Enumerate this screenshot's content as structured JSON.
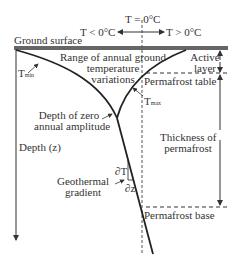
{
  "diagram": {
    "title_t0": "T = 0°C",
    "t_below": "T < 0°C",
    "t_above": "T > 0°C",
    "ground_surface": "Ground surface",
    "range_line1": "Range of annual ground",
    "range_line2": "temperature",
    "range_line3": "variations",
    "active_line1": "Active",
    "active_line2": "layer",
    "permafrost_table": "Permafrost table",
    "tmin_main": "T",
    "tmin_sub": "min",
    "tmax_main": "T",
    "tmax_sub": "max",
    "zero_amp_line1": "Depth of zero",
    "zero_amp_line2": "annual amplitude",
    "depth": "Depth (z)",
    "thickness_line1": "Thickness of",
    "thickness_line2": "permafrost",
    "dT": "∂T",
    "dz": "∂z",
    "geo_line1": "Geothermal",
    "geo_line2": "gradient",
    "permafrost_base": "Permafrost base",
    "colors": {
      "line": "#222222",
      "surface": "#666666",
      "dashed": "#555555"
    }
  }
}
